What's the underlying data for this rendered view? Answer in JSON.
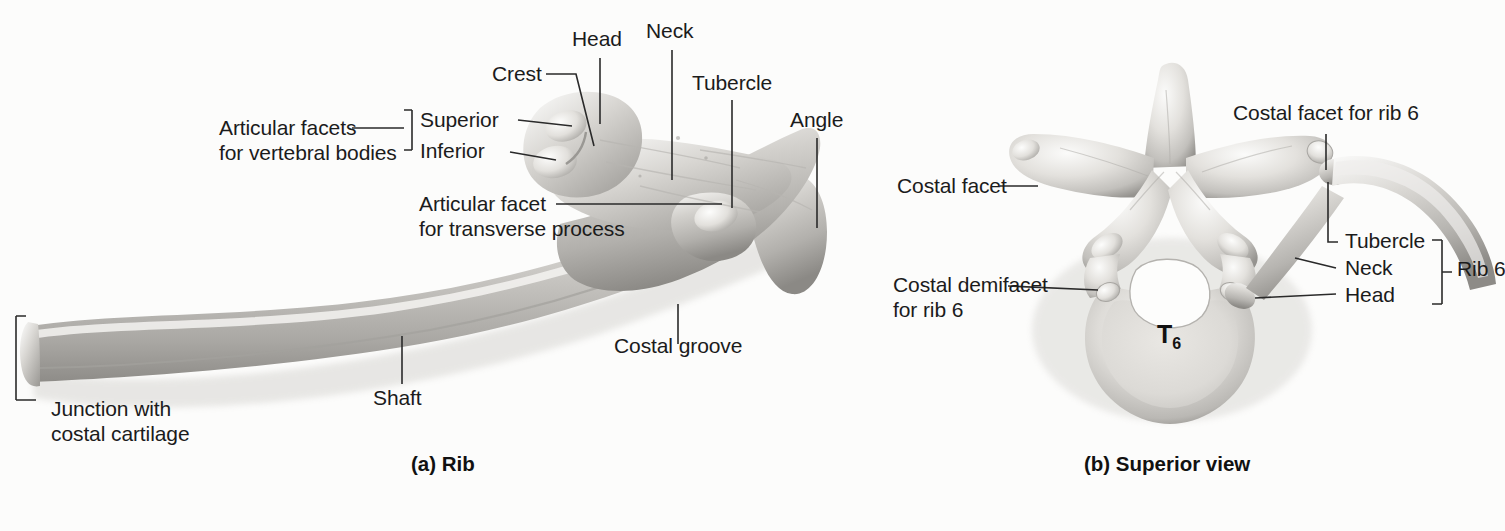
{
  "figure": {
    "background": "#fcfcfb",
    "ink": "#1b1b1b",
    "bone_light": "#f2f1ef",
    "bone_mid": "#c9c7c4",
    "bone_dark": "#8f8d8a"
  },
  "panel_a": {
    "caption": "(a) Rib",
    "labels": {
      "articular_facets": "Articular facets",
      "for_vertebral_bodies": "for vertebral bodies",
      "superior": "Superior",
      "inferior": "Inferior",
      "crest": "Crest",
      "head": "Head",
      "neck": "Neck",
      "tubercle": "Tubercle",
      "angle": "Angle",
      "articular_facet": "Articular facet",
      "for_transverse_process": "for transverse process",
      "costal_groove": "Costal groove",
      "shaft": "Shaft",
      "junction_with": "Junction with",
      "costal_cartilage": "costal cartilage"
    }
  },
  "panel_b": {
    "caption": "(b) Superior view",
    "labels": {
      "costal_facet": "Costal facet",
      "costal_facet_for_rib_6": "Costal facet for rib 6",
      "costal_demifacet": "Costal demifacet",
      "for_rib_6": "for rib 6",
      "tubercle": "Tubercle",
      "neck": "Neck",
      "head": "Head",
      "rib_6": "Rib 6",
      "vertebra": "T",
      "vertebra_sub": "6"
    }
  }
}
